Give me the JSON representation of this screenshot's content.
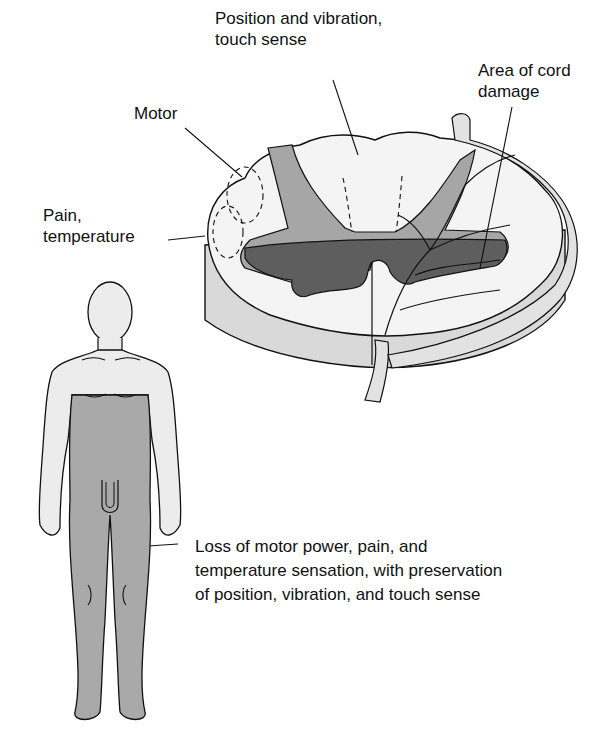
{
  "diagram": {
    "type": "anatomical illustration",
    "labels": {
      "position_vibration": [
        "Position and vibration,",
        "touch sense"
      ],
      "motor": [
        "Motor"
      ],
      "pain_temperature": [
        "Pain,",
        "temperature"
      ],
      "cord_damage": [
        "Area of cord",
        "damage"
      ],
      "body_loss": [
        "Loss of motor power, pain, and",
        "temperature sensation, with preservation",
        "of position, vibration, and touch sense"
      ]
    },
    "colors": {
      "white_matter": "#f4f4f4",
      "gray_matter": "#a6a6a6",
      "damaged_area": "#5e5e5e",
      "cord_side": "#d9d9d9",
      "body_unaffected": "#ececec",
      "body_affected": "#a9a9a9",
      "outline": "#111111"
    }
  }
}
